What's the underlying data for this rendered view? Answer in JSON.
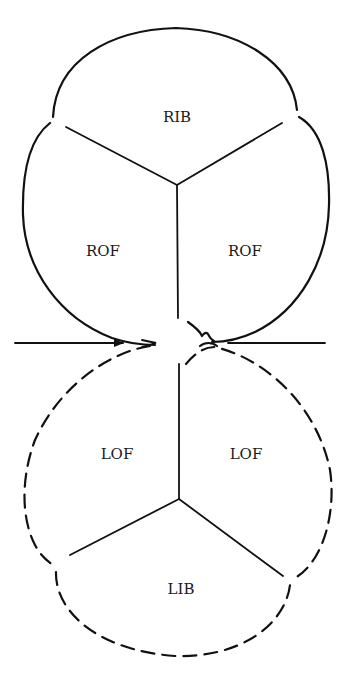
{
  "diagram": {
    "colors": {
      "stroke": "#111111",
      "background": "#ffffff"
    },
    "upper_body": {
      "style": "solid",
      "regions": [
        {
          "label": "RIB",
          "x": 177,
          "y": 118
        },
        {
          "label": "ROF",
          "x": 103,
          "y": 252
        },
        {
          "label": "ROF",
          "x": 245,
          "y": 252
        }
      ]
    },
    "lower_body": {
      "style": "dashed",
      "regions": [
        {
          "label": "LOF",
          "x": 117,
          "y": 455
        },
        {
          "label": "LOF",
          "x": 246,
          "y": 455
        },
        {
          "label": "LIB",
          "x": 181,
          "y": 590
        }
      ]
    },
    "arrows": [
      {
        "name": "left-arrow",
        "direction": "right"
      },
      {
        "name": "right-line",
        "direction": "none"
      }
    ]
  }
}
